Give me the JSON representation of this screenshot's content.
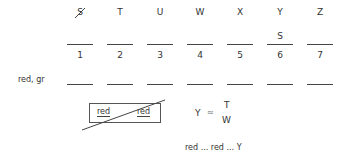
{
  "top_letters": [
    {
      "char": "S",
      "struck": true
    },
    {
      "char": "T",
      "struck": false
    },
    {
      "char": "U",
      "struck": false
    },
    {
      "char": "W",
      "struck": false
    },
    {
      "char": "X",
      "struck": false
    },
    {
      "char": "Y",
      "struck": false
    },
    {
      "char": "Z",
      "struck": false
    }
  ],
  "blank_values": [
    "",
    "",
    "",
    "",
    "",
    "S",
    ""
  ],
  "numbers": [
    "1",
    "2",
    "3",
    "4",
    "5",
    "6",
    "7"
  ],
  "row_label": "red, gr",
  "crossed_box": {
    "left": "red",
    "right": "red"
  },
  "relation": {
    "lhs": "Y",
    "symbol": "≈",
    "top": "T",
    "bottom": "W"
  },
  "sequence": "red ... red ... Y"
}
